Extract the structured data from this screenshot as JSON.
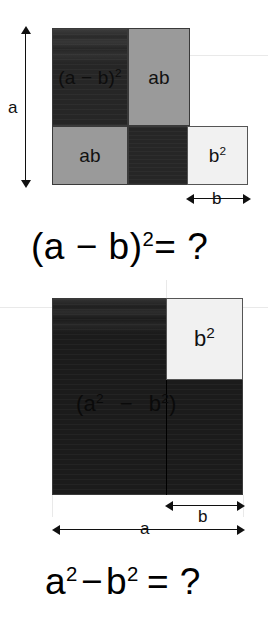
{
  "figure": {
    "title_text": "",
    "background_color": "#ffffff",
    "palette": {
      "dark": "#262626",
      "darker": "#1b1b1b",
      "gray": "#9a9a9a",
      "light": "#f1f1f1",
      "stroke": "#3a3a3a",
      "text": "#101010",
      "guide": "#e9e9e9"
    }
  },
  "panel_one": {
    "name": "square-of-a-difference-diagram",
    "regions": [
      {
        "key": "a_minus_b_squared",
        "label_plain": "(a − b)²",
        "label_base": "(a − b)",
        "label_sup": "2",
        "tone": "dark"
      },
      {
        "key": "ab_top_right",
        "label_plain": "ab",
        "label_base": "ab",
        "label_sup": "",
        "tone": "gray"
      },
      {
        "key": "ab_bottom_left",
        "label_plain": "ab",
        "label_base": "ab",
        "label_sup": "",
        "tone": "gray"
      },
      {
        "key": "b_squared_overlap",
        "label_plain": "",
        "label_base": "",
        "label_sup": "",
        "tone": "dark"
      },
      {
        "key": "b_squared_outside",
        "label_plain": "b²",
        "label_base": "b",
        "label_sup": "2",
        "tone": "light"
      }
    ],
    "dimensions": [
      {
        "key": "height_a",
        "label": "a",
        "orientation": "vertical"
      },
      {
        "key": "width_b",
        "label": "b",
        "orientation": "horizontal"
      }
    ],
    "equation": {
      "full": "(a − b)² = ?",
      "lhs_base": "(a − b)",
      "lhs_sup": "2",
      "rhs": "= ?"
    }
  },
  "panel_two": {
    "name": "difference-of-squares-diagram",
    "regions": [
      {
        "key": "a_squared_minus_b_squared",
        "label_plain": "(a² − b²)",
        "tone": "darker"
      },
      {
        "key": "b_squared_corner",
        "label_plain": "b²",
        "label_base": "b",
        "label_sup": "2",
        "tone": "light"
      }
    ],
    "inner_label": {
      "part1_base": "(a",
      "part1_sup": "2",
      "minus": "−",
      "part2_base": "b",
      "part2_sup": "2",
      "close": ")"
    },
    "dimensions": [
      {
        "key": "width_a",
        "label": "a",
        "orientation": "horizontal"
      },
      {
        "key": "width_b",
        "label": "b",
        "orientation": "horizontal"
      }
    ],
    "equation": {
      "full": "a² − b² = ?",
      "term1_base": "a",
      "term1_sup": "2",
      "minus": "−",
      "term2_base": "b",
      "term2_sup": "2",
      "rhs": "= ?"
    }
  }
}
